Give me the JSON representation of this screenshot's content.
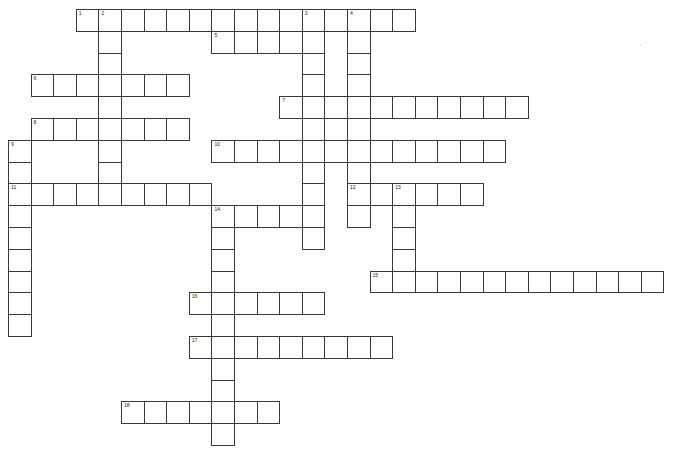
{
  "puzzle": {
    "title": "Crossword grid",
    "grid_origin_px": {
      "x": 8,
      "y": 9
    },
    "cell_size_px": {
      "w": 22.6,
      "h": 21.8
    },
    "border_color": "#3a3a3a",
    "background": "#ffffff",
    "entries": [
      {
        "number": "1",
        "direction": "across",
        "row": 0,
        "col": 3,
        "length": 15
      },
      {
        "number": "2",
        "direction": "down",
        "row": 0,
        "col": 4,
        "length": 9
      },
      {
        "number": "3",
        "direction": "down",
        "row": 0,
        "col": 13,
        "length": 11
      },
      {
        "number": "4",
        "direction": "down",
        "row": 0,
        "col": 15,
        "length": 10
      },
      {
        "number": "5",
        "direction": "across",
        "row": 1,
        "col": 9,
        "length": 5
      },
      {
        "number": "6",
        "direction": "across",
        "row": 3,
        "col": 1,
        "length": 7
      },
      {
        "number": "7",
        "direction": "across",
        "row": 4,
        "col": 12,
        "length": 11
      },
      {
        "number": "8",
        "direction": "across",
        "row": 5,
        "col": 1,
        "length": 7
      },
      {
        "number": "9",
        "direction": "down",
        "row": 6,
        "col": 0,
        "length": 9
      },
      {
        "number": "10",
        "direction": "across",
        "row": 6,
        "col": 9,
        "length": 13
      },
      {
        "number": "11",
        "direction": "across",
        "row": 8,
        "col": 0,
        "length": 9
      },
      {
        "number": "12",
        "direction": "across",
        "row": 8,
        "col": 15,
        "length": 6
      },
      {
        "number": "13",
        "direction": "down",
        "row": 8,
        "col": 17,
        "length": 5
      },
      {
        "number": "14",
        "direction": "across",
        "row": 9,
        "col": 9,
        "length": 5
      },
      {
        "number": "14",
        "direction": "down",
        "row": 9,
        "col": 9,
        "length": 11
      },
      {
        "number": "15",
        "direction": "across",
        "row": 12,
        "col": 16,
        "length": 13
      },
      {
        "number": "16",
        "direction": "across",
        "row": 13,
        "col": 8,
        "length": 6
      },
      {
        "number": "17",
        "direction": "across",
        "row": 15,
        "col": 8,
        "length": 9
      },
      {
        "number": "18",
        "direction": "across",
        "row": 18,
        "col": 5,
        "length": 7
      }
    ]
  }
}
